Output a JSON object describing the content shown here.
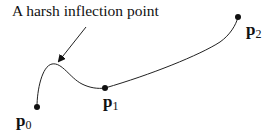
{
  "annotation": "A harsh inflection point",
  "points": [
    {
      "label": "p",
      "sub": "0",
      "x": 37,
      "y": 107
    },
    {
      "label": "p",
      "sub": "1",
      "x": 105,
      "y": 88
    },
    {
      "label": "p",
      "sub": "2",
      "x": 238,
      "y": 17
    }
  ]
}
